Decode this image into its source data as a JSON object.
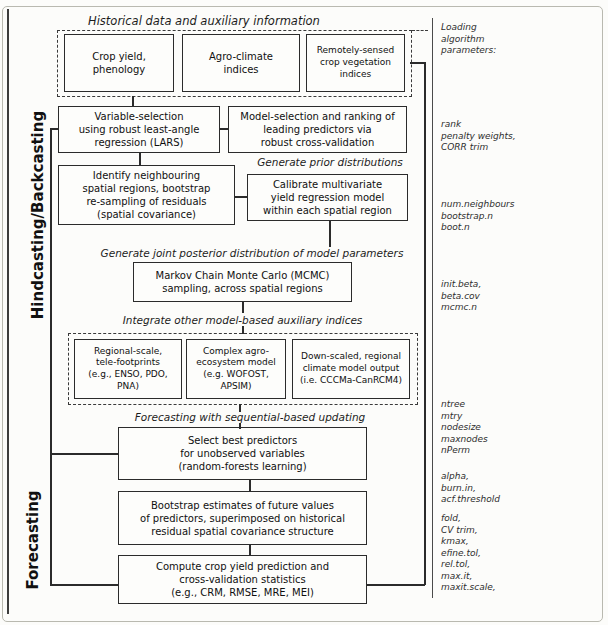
{
  "diagram": {
    "side_labels": {
      "hindcasting": "Hindcasting/Backcasting",
      "forecasting": "Forecasting"
    },
    "historical": {
      "title": "Historical data and auxiliary information",
      "boxes": [
        "Crop yield,\nphenology",
        "Agro-climate\nindices",
        "Remotely-sensed\ncrop vegetation\nindices"
      ]
    },
    "flow_labels": {
      "prior": "Generate prior distributions",
      "posterior": "Generate joint posterior distribution of model parameters",
      "integrate": "Integrate other model-based auxiliary indices",
      "forecast_updating": "Forecasting with sequential-based updating"
    },
    "nodes": {
      "variable_selection": "Variable-selection\nusing robust least-angle\nregression (LARS)",
      "model_selection": "Model-selection and ranking of\nleading predictors via\nrobust cross-validation",
      "identify_neighbouring": "Identify neighbouring\nspatial regions, bootstrap\nre-sampling of residuals\n(spatial covariance)",
      "calibrate": "Calibrate multivariate\nyield regression model\nwithin each spatial region",
      "mcmc": "Markov Chain Monte Carlo (MCMC)\nsampling, across spatial regions",
      "select_best": "Select best predictors\nfor unobserved variables\n(random-forests learning)",
      "bootstrap_future": "Bootstrap estimates of future values\nof predictors, superimposed on historical\nresidual spatial covariance structure",
      "compute_stats": "Compute crop yield prediction and\ncross-validation statistics\n(e.g., CRM, RMSE, MRE, MEI)"
    },
    "aux_boxes": [
      "Regional-scale,\ntele-footprints\n(e.g., ENSO, PDO, PNA)",
      "Complex agro-\necosystem model\n(e.g. WOFOST, APSIM)",
      "Down-scaled, regional\nclimate model output\n(i.e. CCCMa-CanRCM4)"
    ],
    "annotations": {
      "header": "Loading\nalgorithm\nparameters:",
      "groups": [
        "rank\npenalty weights,\nCORR trim",
        "num.neighbours\nbootstrap.n\nboot.n",
        "init.beta,\nbeta.cov\nmcmc.n",
        "ntree\nmtry\nnodesize\nmaxnodes\nnPerm",
        "alpha,\nburn.in,\nacf.threshold",
        "fold,\nCV trim,\nkmax,\nefine.tol,\nrel.tol,\nmax.it,\nmaxit.scale,"
      ]
    },
    "colors": {
      "line": "#2b2b2b",
      "frame": "#b9b9b0",
      "background": "#fcfcfa"
    }
  }
}
